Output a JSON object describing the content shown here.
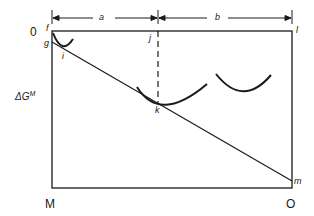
{
  "diagram": {
    "title": "",
    "axis_label": {
      "base": "ΔG",
      "superscript": "M"
    },
    "corner_labels": {
      "top_left": "0",
      "bottom_left": "M",
      "bottom_right": "O"
    },
    "point_labels": {
      "f": "f",
      "g": "g",
      "i": "i",
      "j": "j",
      "k": "k",
      "l": "l",
      "m": "m"
    },
    "dimension_labels": {
      "a": "a",
      "b": "b"
    },
    "colors": {
      "stroke": "#1a1a1a",
      "background": "#ffffff"
    }
  }
}
